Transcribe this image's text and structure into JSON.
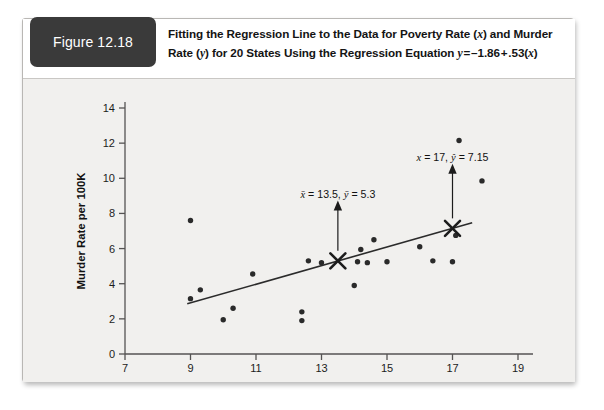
{
  "figure": {
    "badge_label": "Figure 12.18",
    "caption_line1": "Fitting the Regression Line to the Data for Poverty Rate (x) and Murder",
    "caption_line2": "Rate (y) for 20 States Using the Regression Equation y = –1.86 + .53(x)"
  },
  "chart_data": {
    "type": "scatter",
    "title": "",
    "xlabel": "Percent Individuals below Poverty",
    "ylabel": "Murder Rate per 100K",
    "xlim": [
      7,
      19
    ],
    "ylim": [
      0,
      14
    ],
    "xticks": [
      7,
      9,
      11,
      13,
      15,
      17,
      19
    ],
    "yticks": [
      0,
      2,
      4,
      6,
      8,
      10,
      12,
      14
    ],
    "grid": false,
    "legend": "none",
    "n_points": 20,
    "points": [
      {
        "x": 9.0,
        "y": 7.6
      },
      {
        "x": 9.0,
        "y": 3.15
      },
      {
        "x": 9.3,
        "y": 3.65
      },
      {
        "x": 10.0,
        "y": 1.95
      },
      {
        "x": 10.3,
        "y": 2.6
      },
      {
        "x": 10.9,
        "y": 4.55
      },
      {
        "x": 12.4,
        "y": 2.4
      },
      {
        "x": 12.4,
        "y": 1.9
      },
      {
        "x": 12.6,
        "y": 5.3
      },
      {
        "x": 13.0,
        "y": 5.2
      },
      {
        "x": 14.2,
        "y": 5.95
      },
      {
        "x": 14.1,
        "y": 5.25
      },
      {
        "x": 14.4,
        "y": 5.2
      },
      {
        "x": 14.0,
        "y": 3.9
      },
      {
        "x": 14.6,
        "y": 6.5
      },
      {
        "x": 15.0,
        "y": 5.25
      },
      {
        "x": 16.0,
        "y": 6.1
      },
      {
        "x": 16.4,
        "y": 5.3
      },
      {
        "x": 17.0,
        "y": 5.25
      },
      {
        "x": 17.1,
        "y": 6.75
      },
      {
        "x": 17.2,
        "y": 12.15
      },
      {
        "x": 17.9,
        "y": 9.85
      }
    ],
    "regression_line": {
      "equation": "y = -1.86 + .53(x)",
      "intercept": -1.86,
      "slope": 0.53,
      "x_start": 8.9,
      "x_end": 17.6
    },
    "markers": [
      {
        "name": "mean-point",
        "x": 13.5,
        "y": 5.3,
        "label": "x̄ = 13.5, ȳ = 5.3"
      },
      {
        "name": "predicted-point",
        "x": 17.0,
        "y": 7.15,
        "label": "x = 17, ŷ = 7.15"
      }
    ],
    "annotations": [
      {
        "text_plain": "x̄ = 13.5, ȳ = 5.3",
        "x": 13.5,
        "y": 8.9
      },
      {
        "text_plain": "x = 17, ŷ = 7.15",
        "x": 17.0,
        "y": 11.0
      }
    ]
  },
  "colors": {
    "card_background": "#f1f0ee",
    "caption_background": "#ffffff",
    "badge_background": "#3a3a3a",
    "badge_text": "#ffffff",
    "axis": "#555353",
    "point": "#2a2a2a",
    "line": "#2b2b2b"
  }
}
